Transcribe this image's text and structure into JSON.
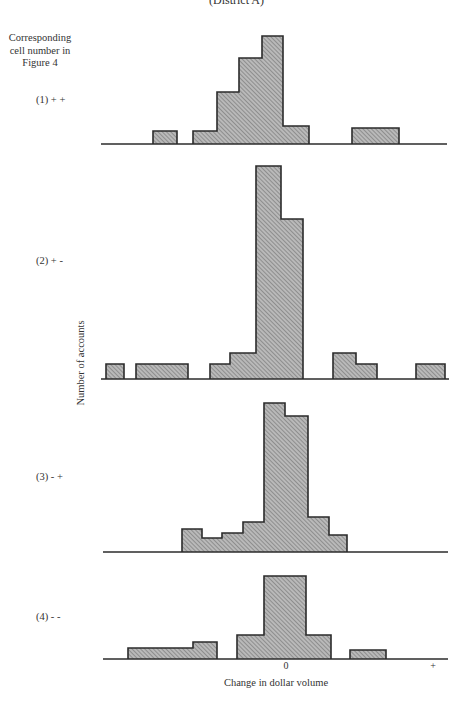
{
  "figure": {
    "title": "(District A)",
    "legend_header": "Corresponding cell number in Figure 4",
    "ylabel": "Number of accounts",
    "xlabel": "Change in dollar volume",
    "x_ticks": [
      {
        "label": "0",
        "x": 286
      },
      {
        "label": "+",
        "x": 433
      }
    ],
    "colors": {
      "bar_fill": "#b9b9b9",
      "hatch": "#6a6a6a",
      "outline": "#2b2b2b",
      "axis": "#2b2b2b",
      "text": "#333333"
    },
    "panels": [
      {
        "label": "(1)  + +",
        "label_y": 94,
        "baseline": 144,
        "axis_x": [
          101,
          447
        ],
        "bars": [
          [
            153,
            177,
            131
          ],
          [
            193,
            217,
            131
          ],
          [
            217,
            239,
            92
          ],
          [
            239,
            262,
            58
          ],
          [
            262,
            283,
            36
          ],
          [
            283,
            309,
            126
          ],
          [
            352,
            399,
            128
          ]
        ]
      },
      {
        "label": "(2)  + -",
        "label_y": 255,
        "baseline": 379,
        "axis_x": [
          101,
          449
        ],
        "bars": [
          [
            106,
            124,
            364
          ],
          [
            136,
            188,
            364
          ],
          [
            210,
            230,
            364
          ],
          [
            230,
            256,
            353
          ],
          [
            256,
            281,
            166
          ],
          [
            281,
            303,
            219
          ],
          [
            333,
            356,
            353
          ],
          [
            356,
            377,
            364
          ],
          [
            416,
            445,
            364
          ]
        ]
      },
      {
        "label": "(3)  - +",
        "label_y": 471,
        "baseline": 552,
        "axis_x": [
          103,
          448
        ],
        "bars": [
          [
            182,
            202,
            529
          ],
          [
            202,
            222,
            538
          ],
          [
            222,
            243,
            533
          ],
          [
            243,
            264,
            522
          ],
          [
            264,
            285,
            403
          ],
          [
            285,
            308,
            416
          ],
          [
            308,
            329,
            517
          ],
          [
            329,
            347,
            535
          ]
        ]
      },
      {
        "label": "(4)  - -",
        "label_y": 611,
        "baseline": 659,
        "axis_x": [
          103,
          448
        ],
        "bars": [
          [
            128,
            193,
            648
          ],
          [
            193,
            217,
            642
          ],
          [
            237,
            264,
            635
          ],
          [
            264,
            306,
            576
          ],
          [
            306,
            331,
            635
          ],
          [
            350,
            386,
            650
          ]
        ]
      }
    ]
  },
  "chart_data": {
    "type": "bar",
    "subtype": "histogram (small multiples, shared x-axis)",
    "title": "(District A)",
    "xlabel": "Change in dollar volume",
    "ylabel": "Number of accounts",
    "x_tick_labels": [
      "0",
      "+"
    ],
    "legend_header": "Corresponding cell number in Figure 4",
    "grid": false,
    "note": "Counts are approximate, estimated from bar heights (no y tick labels shown). Bin positions are relative to 0 on the x-axis in approximate bin-width units (negative = decrease, positive = increase).",
    "panels": [
      {
        "name": "(1) + +",
        "bins": [
          {
            "x_range": [
              -6.2,
              -5.1
            ],
            "count": 1
          },
          {
            "x_range": [
              -4.4,
              -3.3
            ],
            "count": 1
          },
          {
            "x_range": [
              -3.3,
              -2.2
            ],
            "count": 4
          },
          {
            "x_range": [
              -2.2,
              -1.1
            ],
            "count": 7
          },
          {
            "x_range": [
              -1.1,
              0.0
            ],
            "count": 9
          },
          {
            "x_range": [
              0.0,
              1.2
            ],
            "count": 1.5
          },
          {
            "x_range": [
              3.2,
              5.4
            ],
            "count": 1
          }
        ]
      },
      {
        "name": "(2) + -",
        "bins": [
          {
            "x_range": [
              -8.5,
              -7.6
            ],
            "count": 1
          },
          {
            "x_range": [
              -7.0,
              -4.5
            ],
            "count": 1
          },
          {
            "x_range": [
              -3.5,
              -2.5
            ],
            "count": 1
          },
          {
            "x_range": [
              -2.5,
              -1.3
            ],
            "count": 2
          },
          {
            "x_range": [
              -1.3,
              0.0
            ],
            "count": 16
          },
          {
            "x_range": [
              0.0,
              1.0
            ],
            "count": 12
          },
          {
            "x_range": [
              2.4,
              3.5
            ],
            "count": 2
          },
          {
            "x_range": [
              3.5,
              4.5
            ],
            "count": 1
          },
          {
            "x_range": [
              6.3,
              7.6
            ],
            "count": 1
          }
        ]
      },
      {
        "name": "(3) - +",
        "bins": [
          {
            "x_range": [
              -4.9,
              -3.9
            ],
            "count": 2
          },
          {
            "x_range": [
              -3.9,
              -3.0
            ],
            "count": 1
          },
          {
            "x_range": [
              -3.0,
              -2.0
            ],
            "count": 1.5
          },
          {
            "x_range": [
              -2.0,
              -1.0
            ],
            "count": 2.5
          },
          {
            "x_range": [
              -1.0,
              0.0
            ],
            "count": 11
          },
          {
            "x_range": [
              0.0,
              1.1
            ],
            "count": 10
          },
          {
            "x_range": [
              1.1,
              2.1
            ],
            "count": 3
          },
          {
            "x_range": [
              2.1,
              2.9
            ],
            "count": 1
          }
        ]
      },
      {
        "name": "(4) - -",
        "bins": [
          {
            "x_range": [
              -7.5,
              -4.4
            ],
            "count": 1
          },
          {
            "x_range": [
              -4.4,
              -3.3
            ],
            "count": 1.5
          },
          {
            "x_range": [
              -2.3,
              -1.0
            ],
            "count": 2
          },
          {
            "x_range": [
              -1.0,
              1.0
            ],
            "count": 7
          },
          {
            "x_range": [
              1.0,
              2.1
            ],
            "count": 2
          },
          {
            "x_range": [
              3.0,
              4.7
            ],
            "count": 1
          }
        ]
      }
    ]
  }
}
